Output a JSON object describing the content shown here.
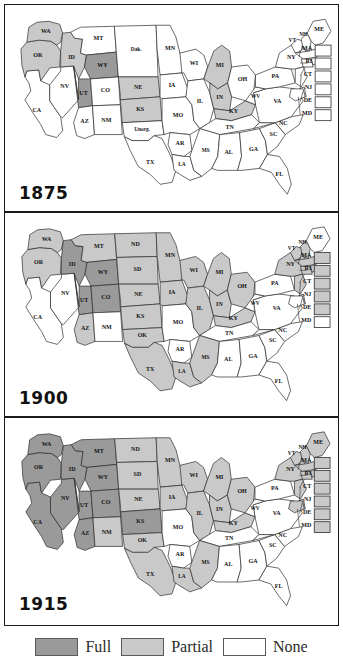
{
  "figure": {
    "colors": {
      "full": "#9a9a9a",
      "partial": "#c9c9c9",
      "none": "#ffffff",
      "outline": "#2b2b2b",
      "frame": "#1a1a1a",
      "text": "#141414"
    }
  },
  "legend": {
    "items": [
      {
        "label": "Full",
        "swatch": "#9a9a9a",
        "key": "full"
      },
      {
        "label": "Partial",
        "swatch": "#c9c9c9",
        "key": "partial"
      },
      {
        "label": "None",
        "swatch": "#ffffff",
        "key": "none"
      }
    ]
  },
  "chart_data": {
    "type": "map",
    "categories": [
      "Full",
      "Partial",
      "None"
    ],
    "legend_position": "bottom",
    "panels": [
      {
        "year": "1875",
        "states": {
          "WA": "partial",
          "OR": "partial",
          "ID": "partial",
          "MT": "none",
          "WY": "full",
          "UT": "full",
          "CA": "none",
          "NV": "none",
          "CO": "none",
          "AZ": "none",
          "NM": "none",
          "DAK": "none",
          "NE": "partial",
          "KS": "partial",
          "UNORG": "none",
          "TX": "none",
          "MN": "none",
          "IA": "none",
          "MO": "none",
          "AR": "none",
          "LA": "none",
          "WI": "none",
          "IL": "none",
          "MI": "partial",
          "IN": "partial",
          "KY": "partial",
          "TN": "none",
          "MS": "none",
          "AL": "none",
          "GA": "none",
          "FL": "none",
          "OH": "none",
          "WV": "none",
          "VA": "none",
          "NC": "none",
          "SC": "none",
          "PA": "none",
          "NY": "none",
          "VT": "none",
          "NH": "none",
          "ME": "none",
          "MA": "none",
          "RI": "none",
          "CT": "none",
          "NJ": "none",
          "DE": "none",
          "MD": "none"
        },
        "territory_labels": {
          "DAK": "Dak.",
          "UNORG": "Unorg."
        }
      },
      {
        "year": "1900",
        "states": {
          "WA": "partial",
          "OR": "partial",
          "ID": "full",
          "MT": "partial",
          "WY": "full",
          "UT": "full",
          "CA": "none",
          "NV": "none",
          "CO": "full",
          "AZ": "partial",
          "NM": "none",
          "ND": "partial",
          "SD": "partial",
          "NE": "partial",
          "KS": "partial",
          "OK": "partial",
          "TX": "partial",
          "MN": "partial",
          "IA": "partial",
          "MO": "none",
          "AR": "none",
          "LA": "partial",
          "WI": "partial",
          "IL": "partial",
          "MI": "partial",
          "IN": "partial",
          "KY": "partial",
          "TN": "none",
          "MS": "partial",
          "AL": "none",
          "GA": "none",
          "FL": "none",
          "OH": "partial",
          "WV": "none",
          "VA": "none",
          "NC": "none",
          "SC": "none",
          "PA": "none",
          "NY": "partial",
          "VT": "partial",
          "NH": "partial",
          "ME": "none",
          "MA": "partial",
          "RI": "partial",
          "CT": "partial",
          "NJ": "partial",
          "DE": "partial",
          "MD": "none"
        },
        "territory_labels": {}
      },
      {
        "year": "1915",
        "states": {
          "WA": "full",
          "OR": "full",
          "ID": "full",
          "MT": "full",
          "WY": "full",
          "UT": "full",
          "CA": "full",
          "NV": "full",
          "CO": "full",
          "AZ": "full",
          "NM": "partial",
          "ND": "partial",
          "SD": "partial",
          "NE": "partial",
          "KS": "full",
          "OK": "partial",
          "TX": "partial",
          "MN": "partial",
          "IA": "partial",
          "MO": "none",
          "AR": "none",
          "LA": "partial",
          "WI": "partial",
          "IL": "partial",
          "MI": "partial",
          "IN": "partial",
          "KY": "partial",
          "TN": "none",
          "MS": "partial",
          "AL": "none",
          "GA": "none",
          "FL": "none",
          "OH": "partial",
          "WV": "none",
          "VA": "none",
          "NC": "none",
          "SC": "none",
          "PA": "none",
          "NY": "partial",
          "VT": "partial",
          "NH": "partial",
          "ME": "partial",
          "MA": "partial",
          "RI": "partial",
          "CT": "partial",
          "NJ": "partial",
          "DE": "partial",
          "MD": "partial"
        },
        "territory_labels": {}
      }
    ],
    "inset_boxes": [
      "MA",
      "RI",
      "CT",
      "NJ",
      "DE",
      "MD"
    ],
    "state_labels": [
      "WA",
      "OR",
      "ID",
      "MT",
      "WY",
      "UT",
      "CA",
      "NV",
      "CO",
      "AZ",
      "NM",
      "ND",
      "SD",
      "Dak.",
      "NE",
      "KS",
      "OK",
      "TX",
      "MN",
      "IA",
      "MO",
      "AR",
      "LA",
      "WI",
      "IL",
      "MI",
      "IN",
      "KY",
      "TN",
      "MS",
      "AL",
      "GA",
      "FL",
      "OH",
      "WV",
      "VA",
      "NC",
      "SC",
      "PA",
      "NY",
      "VT",
      "NH",
      "ME",
      "MA",
      "RI",
      "CT",
      "NJ",
      "DE",
      "MD",
      "Unorg."
    ]
  }
}
